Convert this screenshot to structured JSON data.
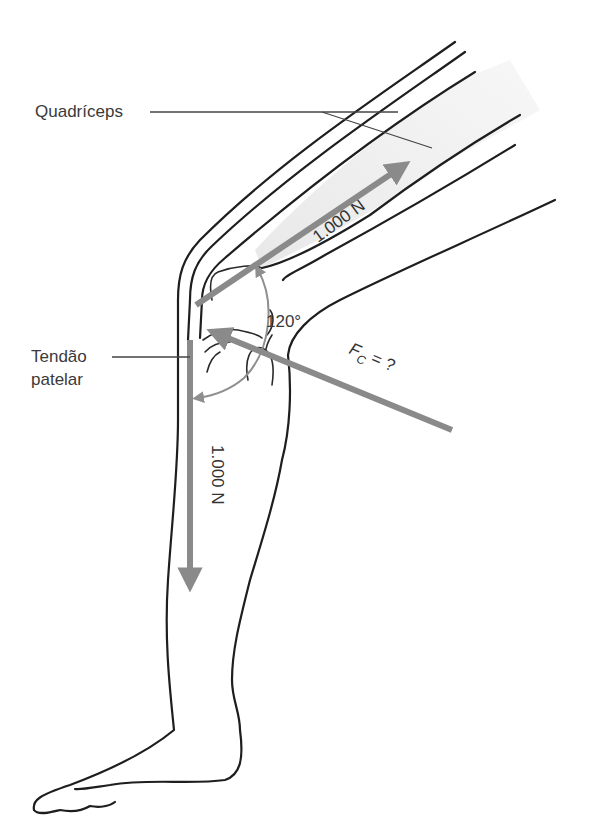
{
  "diagram": {
    "labels": {
      "quadriceps": "Quadríceps",
      "patellar_tendon_line1": "Tendão",
      "patellar_tendon_line2": "patelar"
    },
    "forces": {
      "quadriceps_force": "1.000 N",
      "patellar_tendon_force": "1.000 N",
      "compression_force_symbol": "F",
      "compression_force_subscript": "C",
      "compression_force_value": " = ?"
    },
    "angle": "120°",
    "colors": {
      "outline": "#1e1e1e",
      "force_arrow": "#8a8a8a",
      "muscle_shade": "#ececec",
      "text": "#3a3a3a"
    }
  }
}
